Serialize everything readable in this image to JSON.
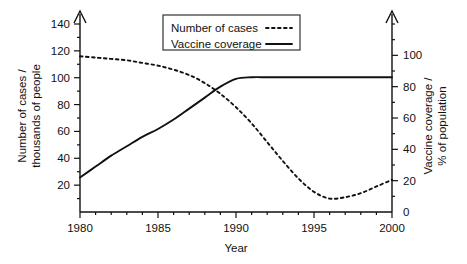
{
  "chart_data": {
    "type": "line",
    "title": "",
    "xlabel": "Year",
    "xlim": [
      1980,
      2000
    ],
    "x_ticks": [
      1980,
      1985,
      1990,
      1995,
      2000
    ],
    "x_minor_interval": 1,
    "grid": false,
    "legend_position": "top-center",
    "axes": [
      {
        "id": "left",
        "label_line1": "Number of cases /",
        "label_line2": "thousands of people",
        "ylim": [
          0,
          140
        ],
        "ticks": [
          20,
          40,
          60,
          80,
          100,
          120,
          140
        ],
        "minor_interval": 10,
        "arrow": true
      },
      {
        "id": "right",
        "label_line1": "Vaccine coverage /",
        "label_line2": "% of population",
        "ylim": [
          0,
          120
        ],
        "ticks": [
          0,
          20,
          40,
          60,
          80,
          100
        ],
        "minor_interval": 10,
        "arrow": true
      }
    ],
    "series": [
      {
        "name": "Number of cases",
        "axis": "left",
        "style": "dotted",
        "color": "#111111",
        "units": "thousands of people",
        "x": [
          1980,
          1981,
          1982,
          1983,
          1984,
          1985,
          1986,
          1987,
          1988,
          1989,
          1990,
          1991,
          1992,
          1993,
          1994,
          1995,
          1996,
          1997,
          1998,
          1999,
          2000
        ],
        "values": [
          116,
          115,
          114,
          113,
          111,
          109,
          106,
          102,
          96,
          88,
          78,
          66,
          52,
          38,
          25,
          15,
          10,
          11,
          14,
          19,
          24
        ]
      },
      {
        "name": "Vaccine coverage",
        "axis": "right",
        "style": "solid",
        "color": "#111111",
        "units": "% of population",
        "x": [
          1980,
          1981,
          1982,
          1983,
          1984,
          1985,
          1986,
          1987,
          1988,
          1989,
          1990,
          1991,
          1992,
          1993,
          1994,
          1995,
          1996,
          1997,
          1998,
          1999,
          2000
        ],
        "values": [
          22,
          29,
          36,
          42,
          48,
          53,
          59,
          66,
          73,
          80,
          85,
          86,
          86,
          86,
          86,
          86,
          86,
          86,
          86,
          86,
          86
        ]
      }
    ],
    "legend": [
      {
        "label": "Number of cases",
        "style": "dotted"
      },
      {
        "label": "Vaccine coverage",
        "style": "solid"
      }
    ],
    "x_tick_labels": [
      "1980",
      "1985",
      "1990",
      "1995",
      "2000"
    ],
    "left_tick_labels": [
      "20",
      "40",
      "60",
      "80",
      "100",
      "120",
      "140"
    ],
    "right_tick_labels": [
      "0",
      "20",
      "40",
      "60",
      "80",
      "100"
    ]
  }
}
